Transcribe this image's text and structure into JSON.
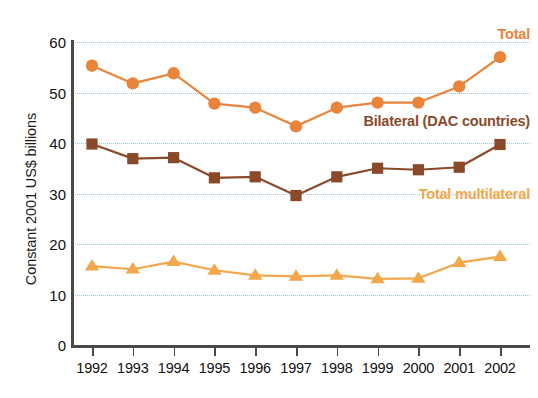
{
  "chart_data": {
    "type": "line",
    "title": "",
    "subtitle": "",
    "xlabel": "",
    "ylabel": "Constant 2001 US$ billions",
    "categories": [
      "1992",
      "1993",
      "1994",
      "1995",
      "1996",
      "1997",
      "1998",
      "1999",
      "2000",
      "2001",
      "2002"
    ],
    "x": [
      1992,
      1993,
      1994,
      1995,
      1996,
      1997,
      1998,
      1999,
      2000,
      2001,
      2002
    ],
    "ylim": [
      0,
      60
    ],
    "xlim": [
      1992,
      2002
    ],
    "y_ticks": [
      0,
      10,
      20,
      30,
      40,
      50,
      60
    ],
    "grid": true,
    "gridlines_at": [
      10,
      20,
      30,
      40,
      50,
      60
    ],
    "legend_position": "inline-right",
    "series": [
      {
        "name": "Total",
        "color": "#E8843C",
        "marker": "circle",
        "values": [
          55.3,
          51.8,
          53.8,
          47.8,
          47.0,
          43.3,
          47.0,
          48.0,
          48.0,
          51.2,
          57.0
        ]
      },
      {
        "name": "Bilateral (DAC countries)",
        "color": "#8A4A2A",
        "marker": "square",
        "values": [
          39.8,
          36.9,
          37.1,
          33.1,
          33.3,
          29.6,
          33.3,
          35.0,
          34.7,
          35.2,
          39.7
        ]
      },
      {
        "name": "Total multilateral",
        "color": "#F2A74B",
        "marker": "triangle",
        "values": [
          15.6,
          15.0,
          16.5,
          14.8,
          13.8,
          13.6,
          13.8,
          13.1,
          13.2,
          16.3,
          17.5
        ]
      }
    ],
    "annotations": [
      {
        "text": "Total",
        "series": "Total",
        "color": "#E8843C"
      },
      {
        "text": "Bilateral (DAC countries)",
        "series": "Bilateral (DAC countries)",
        "color": "#8A4A2A"
      },
      {
        "text": "Total multilateral",
        "series": "Total multilateral",
        "color": "#F2A74B"
      }
    ],
    "colors": {
      "total": "#E8843C",
      "bilateral": "#8A4A2A",
      "multilateral": "#F2A74B",
      "gridline": "#9fc4de",
      "axis": "#4a4a4a",
      "background": "#ffffff"
    }
  }
}
